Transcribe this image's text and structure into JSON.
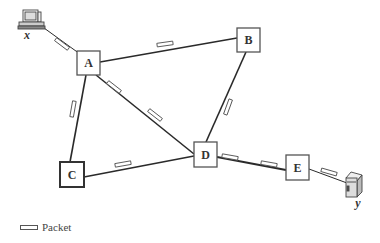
{
  "diagram": {
    "nodes": [
      {
        "id": "A",
        "label": "A",
        "x": 77,
        "y": 51,
        "w": 23,
        "h": 24,
        "thick": false
      },
      {
        "id": "B",
        "label": "B",
        "x": 237,
        "y": 28,
        "w": 23,
        "h": 24,
        "thick": false
      },
      {
        "id": "C",
        "label": "C",
        "x": 60,
        "y": 162,
        "w": 24,
        "h": 25,
        "thick": true
      },
      {
        "id": "D",
        "label": "D",
        "x": 194,
        "y": 142,
        "w": 23,
        "h": 25,
        "thick": false
      },
      {
        "id": "E",
        "label": "E",
        "x": 286,
        "y": 155,
        "w": 23,
        "h": 25,
        "thick": false
      }
    ],
    "hosts": [
      {
        "id": "x",
        "label": "x",
        "type": "computer"
      },
      {
        "id": "y",
        "label": "y",
        "type": "server"
      }
    ],
    "links": [
      {
        "from": "x",
        "to": "A"
      },
      {
        "from": "A",
        "to": "B"
      },
      {
        "from": "A",
        "to": "C"
      },
      {
        "from": "A",
        "to": "D"
      },
      {
        "from": "B",
        "to": "D"
      },
      {
        "from": "C",
        "to": "D"
      },
      {
        "from": "D",
        "to": "E"
      },
      {
        "from": "E",
        "to": "y"
      }
    ],
    "packets": [
      {
        "link": "x-A",
        "cx": 62,
        "cy": 44,
        "angle": 37
      },
      {
        "link": "A-B",
        "cx": 165,
        "cy": 44,
        "angle": -8
      },
      {
        "link": "A-C",
        "cx": 73,
        "cy": 109,
        "angle": -80
      },
      {
        "link": "A-D",
        "cx": 114,
        "cy": 87,
        "angle": 38
      },
      {
        "link": "A-D",
        "cx": 155,
        "cy": 115,
        "angle": 38
      },
      {
        "link": "B-D",
        "cx": 228,
        "cy": 107,
        "angle": -70
      },
      {
        "link": "C-D",
        "cx": 123,
        "cy": 164,
        "angle": -10
      },
      {
        "link": "D-E",
        "cx": 230,
        "cy": 157,
        "angle": 10
      },
      {
        "link": "D-E",
        "cx": 269,
        "cy": 164,
        "angle": 10
      },
      {
        "link": "E-y",
        "cx": 329,
        "cy": 172,
        "angle": 16
      }
    ]
  },
  "labels": {
    "A": "A",
    "B": "B",
    "C": "C",
    "D": "D",
    "E": "E",
    "x": "x",
    "y": "y"
  },
  "legend": {
    "packet_label": "Packet"
  },
  "colors": {
    "line": "#2a2a2a",
    "node_border": "#555555",
    "node_fill": "#ffffff"
  }
}
